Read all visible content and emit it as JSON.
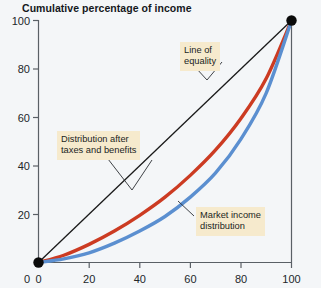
{
  "chart_data": {
    "type": "line",
    "title": "Cumulative percentage of income",
    "xlabel": "",
    "ylabel": "",
    "xlim": [
      0,
      100
    ],
    "ylim": [
      0,
      100
    ],
    "xticks": [
      "0",
      "20",
      "40",
      "60",
      "80",
      "100"
    ],
    "yticks": [
      "0",
      "20",
      "40",
      "60",
      "80",
      "100"
    ],
    "grid": false,
    "legend_position": "none",
    "series": [
      {
        "name": "Line of equality",
        "color": "#1a1a1a",
        "x": [
          0,
          100
        ],
        "values": [
          0,
          100
        ]
      },
      {
        "name": "Distribution after taxes and benefits",
        "color": "#cc3b22",
        "x": [
          0,
          10,
          20,
          30,
          40,
          50,
          60,
          70,
          80,
          90,
          100
        ],
        "values": [
          0,
          3,
          7.5,
          13,
          19.5,
          27,
          36,
          46.5,
          59.5,
          76,
          100
        ]
      },
      {
        "name": "Market income distribution",
        "color": "#5b8fd0",
        "x": [
          0,
          10,
          20,
          30,
          40,
          50,
          60,
          70,
          80,
          90,
          100
        ],
        "values": [
          0,
          1.5,
          4,
          8,
          13,
          19,
          27,
          37,
          51,
          70,
          100
        ]
      }
    ],
    "annotations": [
      {
        "id": "equality",
        "text": "Line of\nequality"
      },
      {
        "id": "after-tax",
        "text": "Distribution after\ntaxes and benefits"
      },
      {
        "id": "market",
        "text": "Market income\ndistribution"
      }
    ],
    "markers": [
      {
        "x": 0,
        "y": 0,
        "color": "#0a0a0a"
      },
      {
        "x": 100,
        "y": 100,
        "color": "#0a0a0a"
      }
    ]
  },
  "colors": {
    "background": "#f4f6f8",
    "axis": "#5a6066",
    "equality_line": "#1a1a1a",
    "after_tax_curve": "#cc3b22",
    "market_curve": "#5b8fd0",
    "annotation_bg": "#f6eacd",
    "text": "#14181c"
  }
}
